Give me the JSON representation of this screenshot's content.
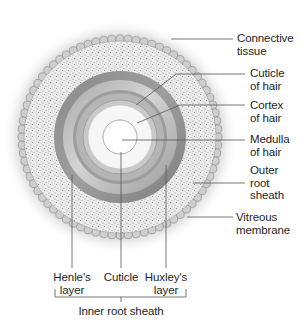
{
  "figure": {
    "center": [
      120,
      137
    ],
    "colors": {
      "background": "#ffffff",
      "halo": "#d9d9d9",
      "vitreous_beads": "#bdbdbd",
      "outer_root_sheath": "#e9e9e9",
      "henles_layer": "#8f8f8f",
      "huxleys_layer_light": "#c7c7c7",
      "huxleys_layer_dark": "#9a9a9a",
      "cuticle": "#a7a7a7",
      "cortex": "#f4f4f4",
      "medulla": "#ffffff",
      "line": "#444444"
    }
  },
  "labels": {
    "connective_tissue": [
      "Connective",
      "tissue"
    ],
    "cuticle_of_hair": [
      "Cuticle",
      "of hair"
    ],
    "cortex_of_hair": [
      "Cortex",
      "of hair"
    ],
    "medulla_of_hair": [
      "Medulla",
      "of hair"
    ],
    "outer_root_sheath": [
      "Outer",
      "root",
      "sheath"
    ],
    "vitreous_membrane": [
      "Vitreous",
      "membrane"
    ],
    "henles_layer": [
      "Henle's",
      "layer"
    ],
    "cuticle": [
      "Cuticle"
    ],
    "huxleys_layer": [
      "Huxley's",
      "layer"
    ],
    "inner_root_sheath": "Inner root sheath"
  }
}
